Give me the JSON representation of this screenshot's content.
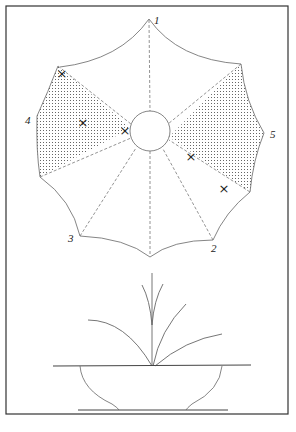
{
  "figure": {
    "type": "line-drawing",
    "labels": [
      {
        "id": "1",
        "text": "1",
        "x": 153,
        "y": 23
      },
      {
        "id": "2",
        "text": "2",
        "x": 213,
        "y": 250
      },
      {
        "id": "3",
        "text": "3",
        "x": 68,
        "y": 240
      },
      {
        "id": "4",
        "text": "4",
        "x": 25,
        "y": 124
      },
      {
        "id": "5",
        "text": "5",
        "x": 270,
        "y": 138
      }
    ],
    "markers": [
      {
        "symbol": "×",
        "x": 62,
        "y": 73
      },
      {
        "symbol": "×",
        "x": 83,
        "y": 122
      },
      {
        "symbol": "×",
        "x": 125,
        "y": 130
      },
      {
        "symbol": "×",
        "x": 191,
        "y": 156
      },
      {
        "symbol": "×",
        "x": 224,
        "y": 188
      }
    ],
    "colors": {
      "line": "#555555",
      "frame": "#333333",
      "dots": "#777777",
      "background": "#ffffff"
    },
    "caption": "(illegible, cropped)"
  }
}
